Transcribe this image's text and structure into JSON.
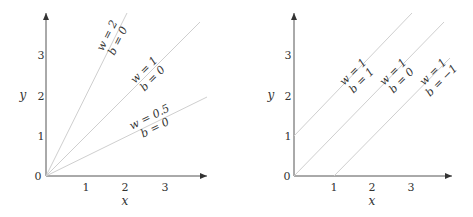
{
  "panels": [
    {
      "id": "left",
      "x_label": "x",
      "y_label": "y",
      "x_ticks": [
        "1",
        "2",
        "3"
      ],
      "y_ticks": [
        "0",
        "1",
        "2",
        "3"
      ],
      "lines": [
        {
          "w": "2",
          "b": "0",
          "w_text": "w = 2",
          "b_text": "b = 0"
        },
        {
          "w": "1",
          "b": "0",
          "w_text": "w = 1",
          "b_text": "b = 0"
        },
        {
          "w": "0.5",
          "b": "0",
          "w_text": "w = 0.5",
          "b_text": "b = 0"
        }
      ]
    },
    {
      "id": "right",
      "x_label": "x",
      "y_label": "y",
      "x_ticks": [
        "1",
        "2",
        "3"
      ],
      "y_ticks": [
        "0",
        "1",
        "2",
        "3"
      ],
      "lines": [
        {
          "w": "1",
          "b": "1",
          "w_text": "w = 1",
          "b_text": "b = 1"
        },
        {
          "w": "1",
          "b": "0",
          "w_text": "w = 1",
          "b_text": "b = 0"
        },
        {
          "w": "1",
          "b": "-1",
          "w_text": "w = 1",
          "b_text": "b = −1"
        }
      ]
    }
  ],
  "colors": {
    "axis": "#555555",
    "line": "#cfcfcf",
    "text": "#333333"
  }
}
